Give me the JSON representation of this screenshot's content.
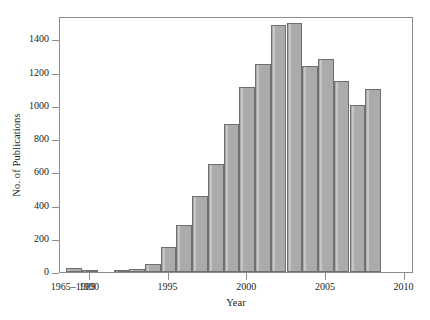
{
  "chart_data": {
    "type": "bar",
    "title": "",
    "xlabel": "Year",
    "ylabel": "No. of Publications",
    "categories": [
      "1965–1989",
      "1990",
      "1991",
      "1992",
      "1993",
      "1994",
      "1995",
      "1996",
      "1997",
      "1998",
      "1999",
      "2000",
      "2001",
      "2002",
      "2003",
      "2004",
      "2005",
      "2006",
      "2007",
      "2008"
    ],
    "values": [
      25,
      8,
      0,
      8,
      18,
      48,
      152,
      285,
      455,
      650,
      890,
      1110,
      1250,
      1485,
      1498,
      1240,
      1280,
      1150,
      1005,
      1100
    ],
    "ylim": [
      0,
      1540
    ],
    "yticks": [
      0,
      200,
      400,
      600,
      800,
      1000,
      1200,
      1400
    ],
    "ytick_labels": [
      "0",
      "200",
      "400",
      "600",
      "800",
      "1000",
      "1200",
      "1400"
    ],
    "xtick_labels": [
      "1965–1989",
      "1990",
      "1995",
      "2000",
      "2005",
      "2010"
    ],
    "xtick_years": [
      1989,
      1990,
      1995,
      2000,
      2005,
      2010
    ],
    "xlim": [
      1988.1,
      2010.6
    ],
    "grid": false,
    "legend": null,
    "bar_color": "#ababab",
    "bar_edge_color": "#6f6f6f",
    "axis_color": "#8d8d8d",
    "text_color": "#232323",
    "background": "#ffffff"
  }
}
